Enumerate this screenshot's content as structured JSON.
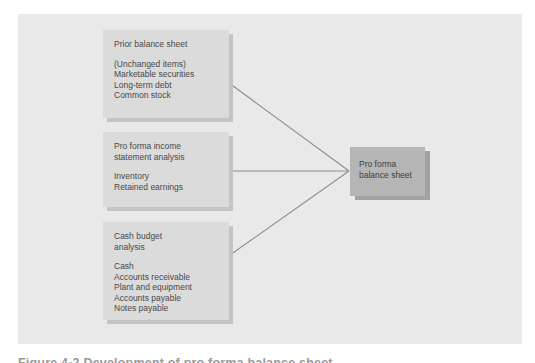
{
  "figure": {
    "caption": "Figure 4-2  Development of pro forma balance sheet",
    "canvas_color": "#e9e9e9",
    "box_color": "#dbdbdb",
    "accent_box_color": "#b5b5b5",
    "line_color": "#8c8c8c",
    "text_color": "#4a4a4a"
  },
  "diagram_data": {
    "type": "flow",
    "nodes": [
      {
        "id": "prior-balance-sheet",
        "title": "Prior balance sheet",
        "items": [
          "(Unchanged items)",
          "Marketable securities",
          "Long-term debt",
          "Common stock"
        ]
      },
      {
        "id": "pro-forma-income",
        "title": "Pro forma income\nstatement analysis",
        "items": [
          "Inventory",
          "Retained earnings"
        ]
      },
      {
        "id": "cash-budget",
        "title": "Cash budget\nanalysis",
        "items": [
          "Cash",
          "Accounts receivable",
          "Plant and equipment",
          "Accounts payable",
          "Notes payable"
        ]
      },
      {
        "id": "pro-forma-balance-sheet",
        "title": "Pro forma\nbalance sheet",
        "items": []
      }
    ],
    "edges": [
      {
        "from": "prior-balance-sheet",
        "to": "pro-forma-balance-sheet"
      },
      {
        "from": "pro-forma-income",
        "to": "pro-forma-balance-sheet"
      },
      {
        "from": "cash-budget",
        "to": "pro-forma-balance-sheet"
      }
    ]
  }
}
